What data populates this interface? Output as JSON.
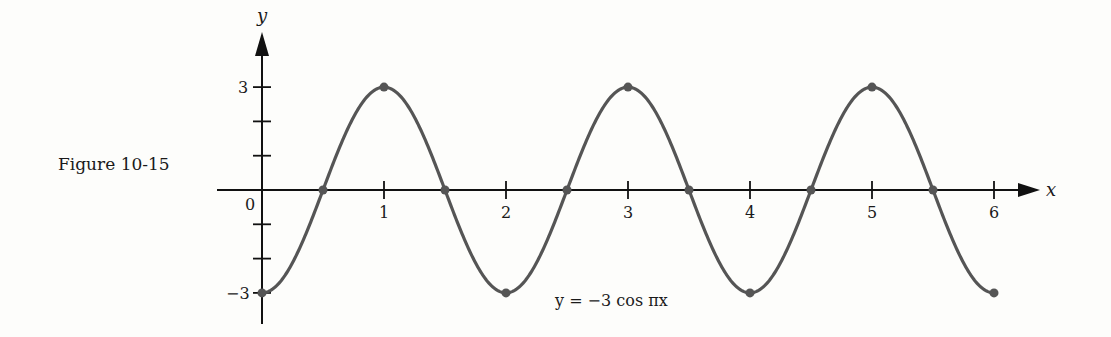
{
  "figure": {
    "label": "Figure 10-15",
    "equation": "y = −3 cos πx"
  },
  "axes": {
    "x_name": "x",
    "y_name": "y",
    "origin_label": "0",
    "x_tick_labels": [
      "1",
      "2",
      "3",
      "4",
      "5",
      "6"
    ],
    "y_tick_labels": {
      "top": "3",
      "bottom": "−3"
    }
  },
  "colors": {
    "curve": "#555555",
    "axes": "#111111",
    "background": "#fdfdfb"
  },
  "chart_data": {
    "type": "line",
    "title": "Figure 10-15",
    "function": "y = -3 cos(pi x)",
    "xlabel": "x",
    "ylabel": "y",
    "xlim": [
      0,
      6
    ],
    "ylim": [
      -3,
      3
    ],
    "x_ticks": [
      1,
      2,
      3,
      4,
      5,
      6
    ],
    "y_ticks": [
      -3,
      -2,
      -1,
      1,
      2,
      3
    ],
    "y_tick_labels_shown": [
      -3,
      3
    ],
    "grid": false,
    "legend": null,
    "annotation": "y = −3 cos πx",
    "marked_points": [
      {
        "x": 0,
        "y": -3
      },
      {
        "x": 0.5,
        "y": 0
      },
      {
        "x": 1,
        "y": 3
      },
      {
        "x": 1.5,
        "y": 0
      },
      {
        "x": 2,
        "y": -3
      },
      {
        "x": 2.5,
        "y": 0
      },
      {
        "x": 3,
        "y": 3
      },
      {
        "x": 3.5,
        "y": 0
      },
      {
        "x": 4,
        "y": -3
      },
      {
        "x": 4.5,
        "y": 0
      },
      {
        "x": 5,
        "y": 3
      },
      {
        "x": 5.5,
        "y": 0
      },
      {
        "x": 6,
        "y": -3
      }
    ],
    "series": [
      {
        "name": "y = -3 cos πx",
        "x": [
          0,
          0.25,
          0.5,
          0.75,
          1,
          1.25,
          1.5,
          1.75,
          2,
          2.25,
          2.5,
          2.75,
          3,
          3.25,
          3.5,
          3.75,
          4,
          4.25,
          4.5,
          4.75,
          5,
          5.25,
          5.5,
          5.75,
          6
        ],
        "y": [
          -3,
          -2.12,
          0,
          2.12,
          3,
          2.12,
          0,
          -2.12,
          -3,
          -2.12,
          0,
          2.12,
          3,
          2.12,
          0,
          -2.12,
          -3,
          -2.12,
          0,
          2.12,
          3,
          2.12,
          0,
          -2.12,
          -3
        ]
      }
    ]
  }
}
